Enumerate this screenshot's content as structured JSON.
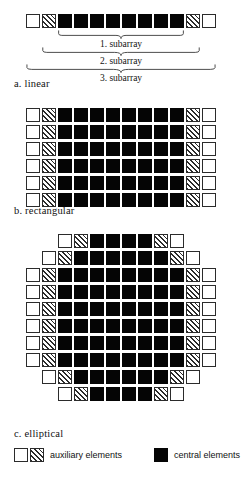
{
  "figure": {
    "cell_types": {
      "white": "white-auxiliary-element",
      "hatch": "hatched-auxiliary-element",
      "black": "black-central-element"
    },
    "colors": {
      "outline": "#2b2b2b",
      "central_fill": "#050505",
      "auxiliary_fill": "#ffffff",
      "background": "#ffffff"
    }
  },
  "linear": {
    "caption": "a. linear",
    "row": [
      "white",
      "hatch",
      "black",
      "black",
      "black",
      "black",
      "black",
      "black",
      "black",
      "black",
      "hatch",
      "white"
    ],
    "subarrays": [
      {
        "label": "1. subarray",
        "span_start": 2,
        "span_end": 9
      },
      {
        "label": "2. subarray",
        "span_start": 1,
        "span_end": 10
      },
      {
        "label": "3. subarray",
        "span_start": 0,
        "span_end": 11
      }
    ]
  },
  "rectangular": {
    "caption": "b. rectangular",
    "rows": [
      [
        "white",
        "hatch",
        "black",
        "black",
        "black",
        "black",
        "black",
        "black",
        "black",
        "black",
        "hatch",
        "white"
      ],
      [
        "white",
        "hatch",
        "black",
        "black",
        "black",
        "black",
        "black",
        "black",
        "black",
        "black",
        "hatch",
        "white"
      ],
      [
        "white",
        "hatch",
        "black",
        "black",
        "black",
        "black",
        "black",
        "black",
        "black",
        "black",
        "hatch",
        "white"
      ],
      [
        "white",
        "hatch",
        "black",
        "black",
        "black",
        "black",
        "black",
        "black",
        "black",
        "black",
        "hatch",
        "white"
      ],
      [
        "white",
        "hatch",
        "black",
        "black",
        "black",
        "black",
        "black",
        "black",
        "black",
        "black",
        "hatch",
        "white"
      ],
      [
        "white",
        "hatch",
        "black",
        "black",
        "black",
        "black",
        "black",
        "black",
        "black",
        "black",
        "hatch",
        "white"
      ]
    ]
  },
  "elliptical": {
    "caption": "c. elliptical",
    "rows": [
      [
        "white",
        "hatch",
        "black",
        "black",
        "black",
        "black",
        "hatch",
        "white"
      ],
      [
        "white",
        "hatch",
        "black",
        "black",
        "black",
        "black",
        "black",
        "black",
        "hatch",
        "white"
      ],
      [
        "white",
        "hatch",
        "black",
        "black",
        "black",
        "black",
        "black",
        "black",
        "black",
        "black",
        "hatch",
        "white"
      ],
      [
        "white",
        "hatch",
        "black",
        "black",
        "black",
        "black",
        "black",
        "black",
        "black",
        "black",
        "hatch",
        "white"
      ],
      [
        "white",
        "hatch",
        "black",
        "black",
        "black",
        "black",
        "black",
        "black",
        "black",
        "black",
        "hatch",
        "white"
      ],
      [
        "white",
        "hatch",
        "black",
        "black",
        "black",
        "black",
        "black",
        "black",
        "black",
        "black",
        "hatch",
        "white"
      ],
      [
        "white",
        "hatch",
        "black",
        "black",
        "black",
        "black",
        "black",
        "black",
        "black",
        "black",
        "hatch",
        "white"
      ],
      [
        "white",
        "hatch",
        "black",
        "black",
        "black",
        "black",
        "black",
        "black",
        "black",
        "black",
        "hatch",
        "white"
      ],
      [
        "white",
        "hatch",
        "black",
        "black",
        "black",
        "black",
        "black",
        "black",
        "hatch",
        "white"
      ],
      [
        "white",
        "hatch",
        "black",
        "black",
        "black",
        "black",
        "hatch",
        "white"
      ]
    ]
  },
  "legend": {
    "auxiliary": {
      "swatches": [
        "white",
        "hatch"
      ],
      "label": "auxiliary elements"
    },
    "central": {
      "swatches": [
        "black"
      ],
      "label": "central elements"
    }
  }
}
